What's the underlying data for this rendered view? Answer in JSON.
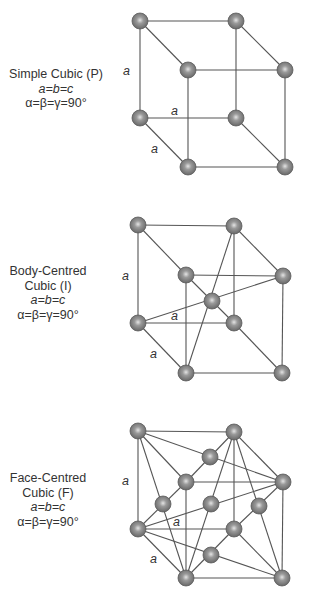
{
  "figure": {
    "panels": [
      {
        "id": "simple-cubic",
        "title_lines": [
          "Simple Cubic (P)"
        ],
        "param_lattice": "a=b=c",
        "param_angles": "α=β=γ=90°",
        "edge_labels": [
          "a",
          "a",
          "a"
        ]
      },
      {
        "id": "body-centred-cubic",
        "title_lines": [
          "Body-Centred",
          "Cubic (I)"
        ],
        "param_lattice": "a=b=c",
        "param_angles": "α=β=γ=90°",
        "edge_labels": [
          "a",
          "a",
          "a"
        ]
      },
      {
        "id": "face-centred-cubic",
        "title_lines": [
          "Face-Centred",
          "Cubic (F)"
        ],
        "param_lattice": "a=b=c",
        "param_angles": "α=β=γ=90°",
        "edge_labels": [
          "a",
          "a",
          "a"
        ]
      }
    ],
    "colors": {
      "atom_fill": "#7a7a7a",
      "atom_edge": "#555555",
      "atom_highlight": "#d8d8d8",
      "line": "#555555",
      "text": "#333333"
    }
  }
}
